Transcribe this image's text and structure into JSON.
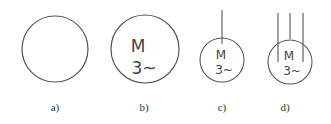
{
  "diagram": {
    "stroke_color": "#555555",
    "symbols": [
      {
        "id": "a",
        "label": "a)",
        "text_top": "",
        "text_bottom": "",
        "leads": 0
      },
      {
        "id": "b",
        "label": "b)",
        "text_top": "M",
        "text_bottom": "3~",
        "leads": 0
      },
      {
        "id": "c",
        "label": "c)",
        "text_top": "M",
        "text_bottom": "3~",
        "leads": 1
      },
      {
        "id": "d",
        "label": "d)",
        "text_top": "M",
        "text_bottom": "3~",
        "leads": 3
      }
    ]
  }
}
